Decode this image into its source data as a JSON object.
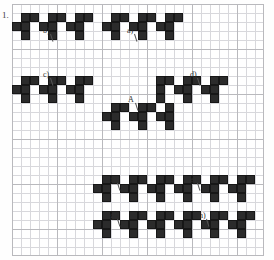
{
  "worksheet": {
    "question_number": "1.",
    "grid": {
      "cols": 28,
      "rows": 28,
      "cell_px": 9,
      "origin_x": 12,
      "origin_y": 4,
      "minor_color": "#d8d8dc",
      "major_color": "#b9b9bd",
      "major_every": 5,
      "background": "#ffffff"
    },
    "cell_color": "#2b2b2b",
    "labels": [
      {
        "id": "b",
        "text": "b)",
        "x": 43,
        "y": 27
      },
      {
        "id": "a",
        "text": "a)",
        "x": 127,
        "y": 27
      },
      {
        "id": "c",
        "text": "c)",
        "x": 43,
        "y": 71
      },
      {
        "id": "d",
        "text": "d)",
        "x": 190,
        "y": 71
      },
      {
        "id": "A",
        "text": "A",
        "x": 128,
        "y": 96
      },
      {
        "id": "f",
        "text": "f)",
        "x": 110,
        "y": 176
      },
      {
        "id": "e",
        "text": "e)",
        "x": 190,
        "y": 176
      },
      {
        "id": "g",
        "text": "g)",
        "x": 110,
        "y": 212
      },
      {
        "id": "h",
        "text": "h)",
        "x": 199,
        "y": 212
      }
    ],
    "shapes": [
      {
        "id": "b",
        "label": "b)",
        "origin_col": 1,
        "origin_row": 3,
        "cells": [
          [
            1,
            1
          ],
          [
            2,
            1
          ],
          [
            4,
            1
          ],
          [
            5,
            1
          ],
          [
            7,
            1
          ],
          [
            8,
            1
          ],
          [
            0,
            2
          ],
          [
            1,
            2
          ],
          [
            3,
            2
          ],
          [
            4,
            2
          ],
          [
            6,
            2
          ],
          [
            7,
            2
          ],
          [
            1,
            3
          ],
          [
            4,
            3
          ],
          [
            7,
            3
          ]
        ]
      },
      {
        "id": "a",
        "label": "a)",
        "origin_col": 10,
        "origin_row": 3,
        "cells": [
          [
            11,
            1
          ],
          [
            12,
            1
          ],
          [
            14,
            1
          ],
          [
            15,
            1
          ],
          [
            17,
            1
          ],
          [
            18,
            1
          ],
          [
            10,
            2
          ],
          [
            11,
            2
          ],
          [
            13,
            2
          ],
          [
            14,
            2
          ],
          [
            16,
            2
          ],
          [
            17,
            2
          ],
          [
            11,
            3
          ],
          [
            14,
            3
          ],
          [
            17,
            3
          ]
        ]
      },
      {
        "id": "c",
        "label": "c)",
        "origin_col": 1,
        "origin_row": 8,
        "cells": [
          [
            1,
            8
          ],
          [
            2,
            8
          ],
          [
            4,
            8
          ],
          [
            5,
            8
          ],
          [
            7,
            8
          ],
          [
            8,
            8
          ],
          [
            0,
            9
          ],
          [
            1,
            9
          ],
          [
            3,
            9
          ],
          [
            4,
            9
          ],
          [
            6,
            9
          ],
          [
            7,
            9
          ],
          [
            1,
            10
          ],
          [
            4,
            10
          ],
          [
            7,
            10
          ]
        ]
      },
      {
        "id": "d",
        "label": "d)",
        "origin_col": 16,
        "origin_row": 8,
        "cells": [
          [
            16,
            8
          ],
          [
            17,
            8
          ],
          [
            19,
            8
          ],
          [
            20,
            8
          ],
          [
            22,
            8
          ],
          [
            23,
            8
          ],
          [
            16,
            9
          ],
          [
            18,
            9
          ],
          [
            19,
            9
          ],
          [
            21,
            9
          ],
          [
            22,
            9
          ],
          [
            16,
            10
          ],
          [
            19,
            10
          ],
          [
            22,
            10
          ]
        ]
      },
      {
        "id": "A",
        "label": "A",
        "origin_col": 10,
        "origin_row": 11,
        "cells": [
          [
            11,
            11
          ],
          [
            12,
            11
          ],
          [
            14,
            11
          ],
          [
            15,
            11
          ],
          [
            17,
            11
          ],
          [
            10,
            12
          ],
          [
            11,
            12
          ],
          [
            13,
            12
          ],
          [
            14,
            12
          ],
          [
            16,
            12
          ],
          [
            17,
            12
          ],
          [
            11,
            13
          ],
          [
            14,
            13
          ],
          [
            17,
            13
          ]
        ]
      },
      {
        "id": "f",
        "label": "f)",
        "origin_col": 9,
        "origin_row": 19,
        "cells": [
          [
            10,
            19
          ],
          [
            11,
            19
          ],
          [
            13,
            19
          ],
          [
            14,
            19
          ],
          [
            16,
            19
          ],
          [
            17,
            19
          ],
          [
            9,
            20
          ],
          [
            10,
            20
          ],
          [
            12,
            20
          ],
          [
            13,
            20
          ],
          [
            15,
            20
          ],
          [
            16,
            20
          ],
          [
            10,
            21
          ],
          [
            13,
            21
          ],
          [
            16,
            21
          ]
        ]
      },
      {
        "id": "e",
        "label": "e)",
        "origin_col": 18,
        "origin_row": 19,
        "cells": [
          [
            19,
            19
          ],
          [
            20,
            19
          ],
          [
            22,
            19
          ],
          [
            23,
            19
          ],
          [
            25,
            19
          ],
          [
            26,
            19
          ],
          [
            18,
            20
          ],
          [
            19,
            20
          ],
          [
            21,
            20
          ],
          [
            22,
            20
          ],
          [
            24,
            20
          ],
          [
            25,
            20
          ],
          [
            19,
            21
          ],
          [
            22,
            21
          ],
          [
            25,
            21
          ]
        ]
      },
      {
        "id": "g",
        "label": "g)",
        "origin_col": 9,
        "origin_row": 23,
        "cells": [
          [
            10,
            23
          ],
          [
            11,
            23
          ],
          [
            13,
            23
          ],
          [
            14,
            23
          ],
          [
            16,
            23
          ],
          [
            17,
            23
          ],
          [
            9,
            24
          ],
          [
            10,
            24
          ],
          [
            12,
            24
          ],
          [
            13,
            24
          ],
          [
            15,
            24
          ],
          [
            16,
            24
          ],
          [
            10,
            25
          ],
          [
            13,
            25
          ],
          [
            16,
            25
          ]
        ]
      },
      {
        "id": "h",
        "label": "h)",
        "origin_col": 18,
        "origin_row": 23,
        "cells": [
          [
            19,
            23
          ],
          [
            20,
            23
          ],
          [
            22,
            23
          ],
          [
            23,
            23
          ],
          [
            25,
            23
          ],
          [
            26,
            23
          ],
          [
            18,
            24
          ],
          [
            19,
            24
          ],
          [
            21,
            24
          ],
          [
            22,
            24
          ],
          [
            24,
            24
          ],
          [
            25,
            24
          ],
          [
            19,
            25
          ],
          [
            22,
            25
          ],
          [
            25,
            25
          ]
        ]
      }
    ]
  }
}
